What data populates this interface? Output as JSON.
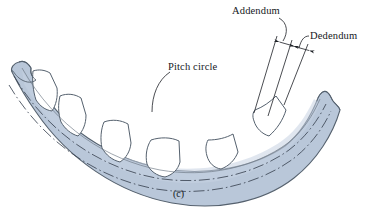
{
  "figure": {
    "caption": "(c)",
    "background_color": "#ffffff",
    "rim_fill_color": "#b9c7d9",
    "rim_fill_color_light": "#cdd8e6",
    "tooth_space_color": "#ffffff",
    "outline_color": "#55616e",
    "centerline_color": "#3c4654",
    "leader_color": "#1d2026",
    "text_color": "#16181c"
  },
  "labels": {
    "addendum": "Addendum",
    "dedendum": "Dedendum",
    "pitch_circle": "Pitch circle"
  },
  "annotations": {
    "dimension_count": 2,
    "dimensions": [
      {
        "name": "Addendum",
        "description": "radial distance from pitch circle to tooth tip"
      },
      {
        "name": "Dedendum",
        "description": "radial distance from pitch circle to tooth root"
      }
    ],
    "leader_lines": [
      {
        "from": "Addendum",
        "target": "addendum-dimension-arrow"
      },
      {
        "from": "Dedendum",
        "target": "dedendum-dimension-arrow"
      },
      {
        "from": "Pitch circle",
        "target": "pitch-circle-centerline"
      }
    ]
  },
  "geometry": {
    "circle_lines": [
      {
        "name": "addendum-circle",
        "style": "solid-thin"
      },
      {
        "name": "pitch-circle",
        "style": "dash-dot"
      },
      {
        "name": "dedendum-circle",
        "style": "dash-dot"
      }
    ],
    "tooth_space_count": 5,
    "arc_shape": "downward-sagging-band",
    "end_style": "torn-break"
  }
}
